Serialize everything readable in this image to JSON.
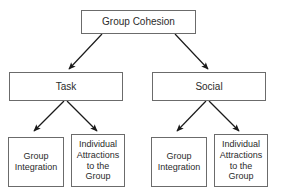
{
  "diagram": {
    "theme": {
      "background": "#ffffff",
      "box_border": "#6b6b6b",
      "box_fill": "#ffffff",
      "text": "#2b2b2b",
      "connector": "#1a1a1a"
    },
    "nodes": {
      "root": {
        "label": "Group Cohesion"
      },
      "task": {
        "label": "Task"
      },
      "social": {
        "label": "Social"
      },
      "task_group_integration": {
        "label": "Group\nIntegration"
      },
      "task_individual_attractions": {
        "label": "Individual\nAttractions\nto the\nGroup"
      },
      "social_group_integration": {
        "label": "Group\nIntegration"
      },
      "social_individual_attractions": {
        "label": "Individual\nAttractions\nto the\nGroup"
      }
    },
    "edges": [
      {
        "from": "root",
        "to": "task"
      },
      {
        "from": "root",
        "to": "social"
      },
      {
        "from": "task",
        "to": "task_group_integration"
      },
      {
        "from": "task",
        "to": "task_individual_attractions"
      },
      {
        "from": "social",
        "to": "social_group_integration"
      },
      {
        "from": "social",
        "to": "social_individual_attractions"
      }
    ]
  }
}
